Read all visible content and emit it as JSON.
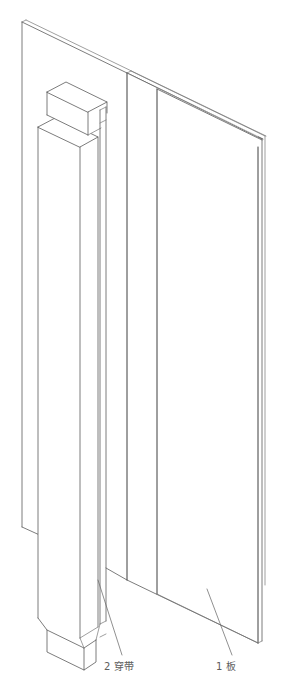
{
  "drawing": {
    "type": "isometric-assembly-exploded-view",
    "background_color": "#ffffff",
    "line_color": "#5a5a5a",
    "text_color": "#5d5d5d",
    "description": "Isometric line drawing of a flat panel board with a vertical batten strip",
    "parts": [
      {
        "number": "1",
        "name": "板",
        "label": "1 板",
        "role": "main-board-panel"
      },
      {
        "number": "2",
        "name": "穿带",
        "label": "2 穿带",
        "role": "batten-cross-strip"
      }
    ]
  },
  "callouts": {
    "batten": {
      "text": "2 穿带",
      "x": 104,
      "y": 668
    },
    "board": {
      "text": "1 板",
      "x": 216,
      "y": 668
    }
  }
}
